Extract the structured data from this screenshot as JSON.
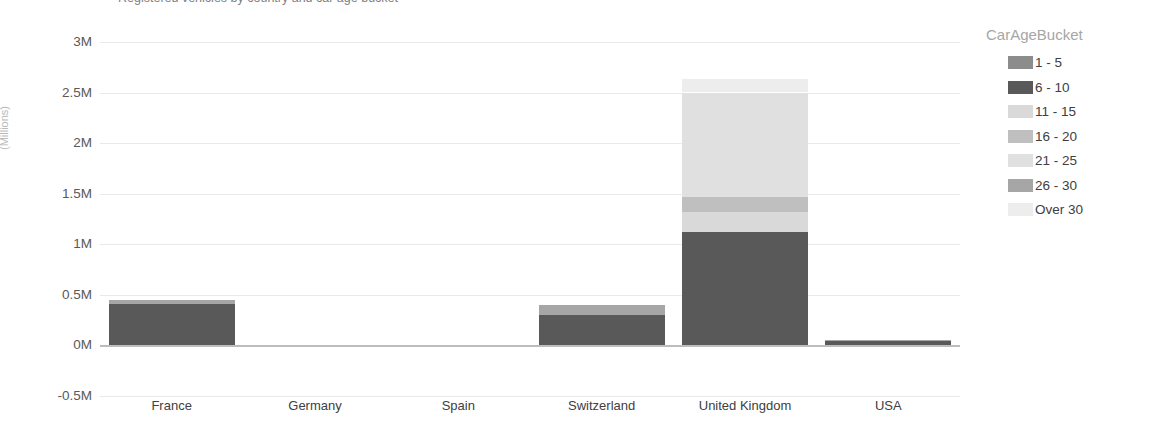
{
  "title_clipped": "Registered vehicles by country and car age bucket",
  "chart_data": {
    "type": "bar",
    "stacked": true,
    "orientation": "vertical",
    "title": "",
    "xlabel": "",
    "ylabel": "(Millions)",
    "ylim": [
      -0.5,
      3.0
    ],
    "ytick_labels": [
      "3M",
      "2.5M",
      "2M",
      "1.5M",
      "1M",
      "0.5M",
      "0M",
      "-0.5M"
    ],
    "ytick_values": [
      3.0,
      2.5,
      2.0,
      1.5,
      1.0,
      0.5,
      0.0,
      -0.5
    ],
    "grid": true,
    "legend_title": "CarAgeBucket",
    "legend_position": "right",
    "categories": [
      "France",
      "Germany",
      "Spain",
      "Switzerland",
      "United Kingdom",
      "USA"
    ],
    "series": [
      {
        "name": "1 - 5",
        "color": "#8c8c8c",
        "values": [
          0.0,
          0.0,
          0.0,
          0.0,
          0.0,
          0.0
        ]
      },
      {
        "name": "6 - 10",
        "color": "#595959",
        "values": [
          0.41,
          0.0,
          0.0,
          0.3,
          1.12,
          0.035
        ]
      },
      {
        "name": "11 - 15",
        "color": "#d9d9d9",
        "values": [
          0.0,
          0.0,
          0.0,
          0.0,
          0.2,
          0.0
        ]
      },
      {
        "name": "16 - 20",
        "color": "#bfbfbf",
        "values": [
          0.0,
          0.0,
          0.0,
          0.0,
          0.15,
          0.0
        ]
      },
      {
        "name": "21 - 25",
        "color": "#e0e0e0",
        "values": [
          0.0,
          0.0,
          0.0,
          0.0,
          1.03,
          0.0
        ]
      },
      {
        "name": "26 - 30",
        "color": "#a6a6a6",
        "values": [
          0.04,
          0.0,
          0.0,
          0.1,
          0.0,
          0.015
        ]
      },
      {
        "name": "Over 30",
        "color": "#ededed",
        "values": [
          0.0,
          0.0,
          0.0,
          0.0,
          0.13,
          0.0
        ]
      }
    ],
    "totals": [
      0.45,
      0.0,
      0.0,
      0.4,
      2.63,
      0.05
    ]
  },
  "legend": {
    "title": "CarAgeBucket",
    "items": [
      {
        "label": "1 - 5",
        "color": "#8c8c8c"
      },
      {
        "label": "6 - 10",
        "color": "#595959"
      },
      {
        "label": "11 - 15",
        "color": "#d9d9d9"
      },
      {
        "label": "16 - 20",
        "color": "#bfbfbf"
      },
      {
        "label": "21 - 25",
        "color": "#e0e0e0"
      },
      {
        "label": "26 - 30",
        "color": "#a6a6a6"
      },
      {
        "label": "Over 30",
        "color": "#ededed"
      }
    ]
  },
  "axis": {
    "y_title": "(Millions)",
    "y_ticks": [
      "3M",
      "2.5M",
      "2M",
      "1.5M",
      "1M",
      "0.5M",
      "0M",
      "-0.5M"
    ],
    "x_ticks": [
      "France",
      "Germany",
      "Spain",
      "Switzerland",
      "United Kingdom",
      "USA"
    ]
  }
}
